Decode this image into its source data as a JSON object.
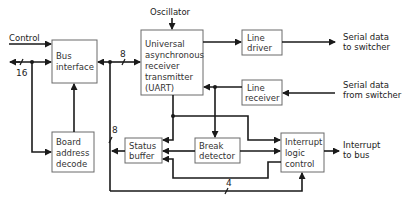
{
  "diagram": {
    "blocks": {
      "bus_interface": {
        "lines": [
          "Bus",
          "interface"
        ]
      },
      "uart": {
        "lines": [
          "Universal",
          "asynchronous",
          "receiver",
          "transmitter",
          "(UART)"
        ]
      },
      "line_driver": {
        "lines": [
          "Line",
          "driver"
        ]
      },
      "line_receiver": {
        "lines": [
          "Line",
          "receiver"
        ]
      },
      "board_address_decode": {
        "lines": [
          "Board",
          "address",
          "decode"
        ]
      },
      "status_buffer": {
        "lines": [
          "Status",
          "buffer"
        ]
      },
      "break_detector": {
        "lines": [
          "Break",
          "detector"
        ]
      },
      "interrupt_logic_control": {
        "lines": [
          "Interrupt",
          "logic",
          "control"
        ]
      }
    },
    "external_labels": {
      "control": "Control",
      "oscillator": "Oscillator",
      "serial_out": [
        "Serial data",
        "to switcher"
      ],
      "serial_in": [
        "Serial data",
        "from switcher"
      ],
      "interrupt_out": [
        "Interrupt",
        "to bus"
      ]
    },
    "bus_widths": {
      "system_bus": "16",
      "data_bus": "8",
      "status_bus": "8",
      "interrupt_bus": "4"
    },
    "colors": {
      "line": "#1a1a1a",
      "box_border": "#6a6a6a",
      "text": "#333333",
      "background": "#ffffff"
    }
  }
}
